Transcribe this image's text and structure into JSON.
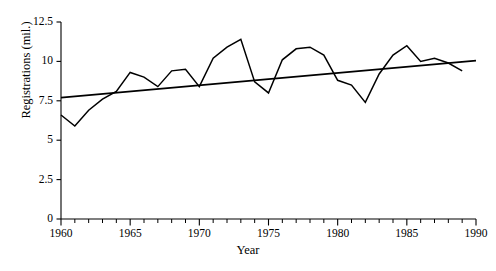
{
  "chart_data": {
    "type": "line",
    "title": "",
    "subtitle": "",
    "xlabel": "Year",
    "ylabel": "Registrations (mil.)",
    "xlim": [
      1960,
      1990
    ],
    "ylim": [
      0,
      12.5
    ],
    "grid": false,
    "legend_position": "none",
    "y_ticks": [
      0,
      2.5,
      5,
      7.5,
      10,
      12.5
    ],
    "y_tick_labels": [
      "0",
      "2.5",
      "5",
      "7.5",
      "10",
      "12.5"
    ],
    "x_ticks": [
      1960,
      1965,
      1970,
      1975,
      1980,
      1985,
      1990
    ],
    "x_tick_labels": [
      "1960",
      "1965",
      "1970",
      "1975",
      "1980",
      "1985",
      "1990"
    ],
    "x_minor_tick_step": 1,
    "series": [
      {
        "name": "Registrations",
        "kind": "line",
        "color": "#000000",
        "x": [
          1960,
          1961,
          1962,
          1963,
          1964,
          1965,
          1966,
          1967,
          1968,
          1969,
          1970,
          1971,
          1972,
          1973,
          1974,
          1975,
          1976,
          1977,
          1978,
          1979,
          1980,
          1981,
          1982,
          1983,
          1984,
          1985,
          1986,
          1987,
          1988,
          1989
        ],
        "values": [
          6.6,
          5.9,
          6.9,
          7.6,
          8.1,
          9.3,
          9.0,
          8.4,
          9.4,
          9.5,
          8.4,
          10.2,
          10.9,
          11.4,
          8.7,
          8.0,
          10.1,
          10.8,
          10.9,
          10.4,
          8.8,
          8.5,
          7.4,
          9.2,
          10.4,
          11.0,
          10.0,
          10.2,
          9.9,
          9.4
        ]
      },
      {
        "name": "Linear trend",
        "kind": "trendline",
        "color": "#000000",
        "x": [
          1960,
          1990
        ],
        "values": [
          7.7,
          10.05
        ]
      }
    ],
    "annotations": []
  },
  "axes": {
    "y_axis_name": "y-axis",
    "x_axis_name": "x-axis"
  },
  "colors": {
    "background": "#ffffff",
    "ink": "#000000",
    "data_line": "#000000",
    "trend_line": "#000000"
  }
}
